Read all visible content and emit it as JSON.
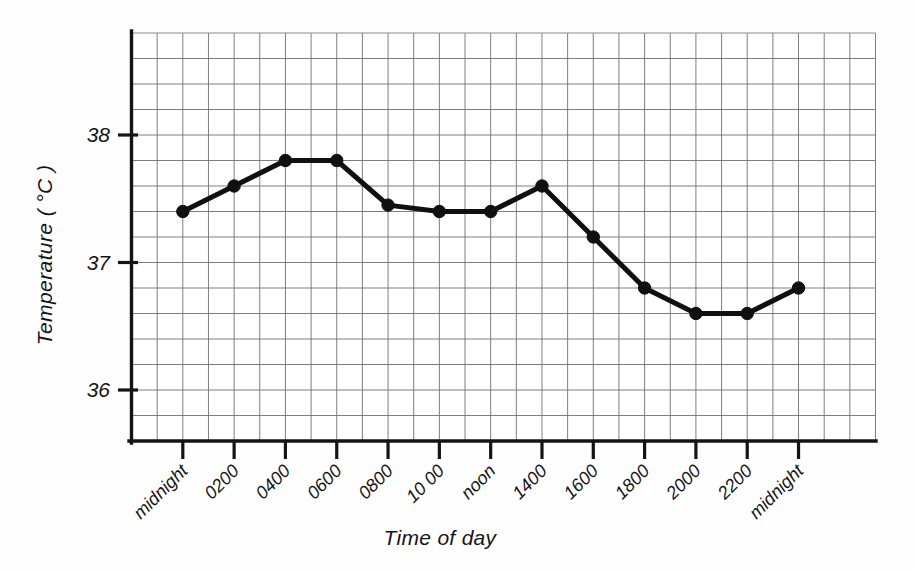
{
  "chart_data": {
    "type": "line",
    "title": "",
    "xlabel": "Time of day",
    "ylabel": "Temperature ( °C )",
    "categories": [
      "midnight",
      "0200",
      "0400",
      "0600",
      "0800",
      "10 00",
      "noon",
      "1400",
      "1600",
      "1800",
      "2000",
      "2200",
      "midnight"
    ],
    "values": [
      37.4,
      37.6,
      37.8,
      37.8,
      37.45,
      37.4,
      37.4,
      37.6,
      37.2,
      36.8,
      36.6,
      36.6,
      36.8
    ],
    "series": [
      {
        "name": "Body temperature",
        "values": [
          37.4,
          37.6,
          37.8,
          37.8,
          37.45,
          37.4,
          37.4,
          37.6,
          37.2,
          36.8,
          36.6,
          36.6,
          36.8
        ]
      }
    ],
    "ylim": [
      35.6,
      38.8
    ],
    "xlim": [
      0,
      12
    ],
    "ytick_labels": [
      "38",
      "37",
      "36"
    ],
    "ytick_values": [
      38,
      37,
      36
    ],
    "minor_y_step": 0.2,
    "grid": true,
    "legend": "none",
    "marker": "filled-circle",
    "line_color": "#101010",
    "grid_color": "#6f6f6f",
    "axis_color": "#141414",
    "background": "#ffffff"
  },
  "axis": {
    "y_title": "Temperature ( °C )",
    "x_title": "Time of day",
    "y_ticks": [
      {
        "label": "38",
        "value": 38
      },
      {
        "label": "37",
        "value": 37
      },
      {
        "label": "36",
        "value": 36
      }
    ],
    "x_ticks": [
      {
        "label": "midnight",
        "index": 0
      },
      {
        "label": "0200",
        "index": 1
      },
      {
        "label": "0400",
        "index": 2
      },
      {
        "label": "0600",
        "index": 3
      },
      {
        "label": "0800",
        "index": 4
      },
      {
        "label": "10 00",
        "index": 5
      },
      {
        "label": "noon",
        "index": 6
      },
      {
        "label": "1400",
        "index": 7
      },
      {
        "label": "1600",
        "index": 8
      },
      {
        "label": "1800",
        "index": 9
      },
      {
        "label": "2000",
        "index": 10
      },
      {
        "label": "2200",
        "index": 11
      },
      {
        "label": "midnight",
        "index": 12
      }
    ]
  }
}
